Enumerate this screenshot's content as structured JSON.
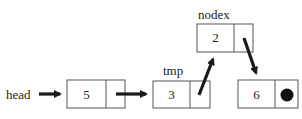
{
  "diagram": {
    "type": "linked-list",
    "labels": {
      "head": "head",
      "tmp": "tmp",
      "nodex": "nodex"
    },
    "nodes": [
      {
        "id": "n1",
        "value": "5",
        "pointer_label": "head",
        "next": "n2"
      },
      {
        "id": "n2",
        "value": "3",
        "pointer_label": "tmp",
        "next": "n3"
      },
      {
        "id": "n3",
        "value": "2",
        "pointer_label": "nodex",
        "next": "n4"
      },
      {
        "id": "n4",
        "value": "6",
        "next": null,
        "null_marker": "filled-circle"
      }
    ],
    "colors": {
      "stroke": "#555555",
      "arrow": "#1a1a1a",
      "null_dot": "#111111"
    }
  }
}
